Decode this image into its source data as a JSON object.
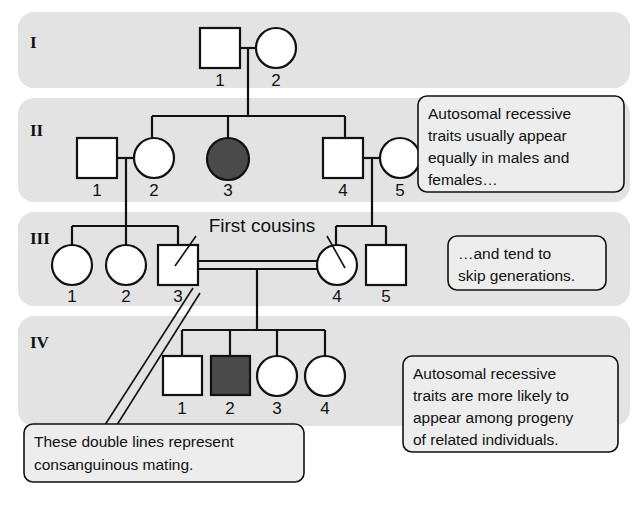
{
  "diagram": {
    "band_color": "#e3e3e3",
    "affected_color": "#4a4a4a",
    "unaffected_color": "#ffffff",
    "line_color": "#111111"
  },
  "generations": [
    {
      "label": "I",
      "individuals": [
        {
          "id": "1",
          "shape": "square",
          "status": "unaffected"
        },
        {
          "id": "2",
          "shape": "circle",
          "status": "unaffected"
        }
      ]
    },
    {
      "label": "II",
      "individuals": [
        {
          "id": "1",
          "shape": "square",
          "status": "unaffected"
        },
        {
          "id": "2",
          "shape": "circle",
          "status": "unaffected"
        },
        {
          "id": "3",
          "shape": "circle",
          "status": "affected"
        },
        {
          "id": "4",
          "shape": "square",
          "status": "unaffected"
        },
        {
          "id": "5",
          "shape": "circle",
          "status": "unaffected"
        }
      ]
    },
    {
      "label": "III",
      "individuals": [
        {
          "id": "1",
          "shape": "circle",
          "status": "unaffected"
        },
        {
          "id": "2",
          "shape": "circle",
          "status": "unaffected"
        },
        {
          "id": "3",
          "shape": "square",
          "status": "unaffected"
        },
        {
          "id": "4",
          "shape": "circle",
          "status": "unaffected"
        },
        {
          "id": "5",
          "shape": "square",
          "status": "unaffected"
        }
      ]
    },
    {
      "label": "IV",
      "individuals": [
        {
          "id": "1",
          "shape": "square",
          "status": "unaffected"
        },
        {
          "id": "2",
          "shape": "square",
          "status": "affected"
        },
        {
          "id": "3",
          "shape": "circle",
          "status": "unaffected"
        },
        {
          "id": "4",
          "shape": "circle",
          "status": "unaffected"
        }
      ]
    }
  ],
  "annotations": {
    "first_cousins": "First cousins"
  },
  "callouts": {
    "males_females": {
      "lines": [
        "Autosomal recessive",
        "traits usually appear",
        "equally in males and",
        "females…"
      ]
    },
    "skip_generations": {
      "lines": [
        "…and tend to",
        "skip generations."
      ]
    },
    "related_individuals": {
      "lines": [
        "Autosomal recessive",
        "traits are more likely to",
        "appear among progeny",
        "of related individuals."
      ]
    },
    "double_lines": {
      "lines": [
        "These double lines represent",
        "consanguinous mating."
      ]
    }
  }
}
